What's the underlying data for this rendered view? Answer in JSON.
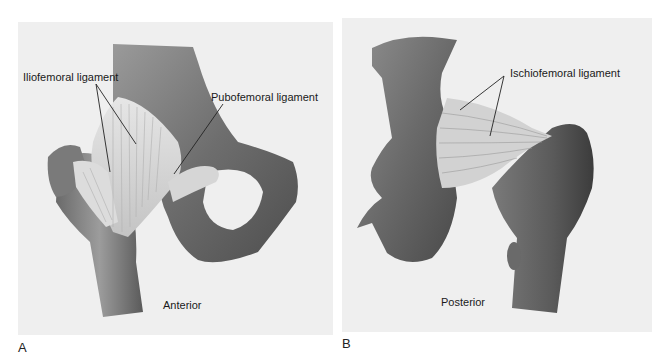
{
  "figure": {
    "panels": [
      {
        "letter": "A",
        "view_label": "Anterior",
        "annotations": [
          {
            "text": "Iliofemoral ligament"
          },
          {
            "text": "Pubofemoral ligament"
          }
        ]
      },
      {
        "letter": "B",
        "view_label": "Posterior",
        "annotations": [
          {
            "text": "Ischiofemoral ligament"
          }
        ]
      }
    ],
    "colors": {
      "background": "#ffffff",
      "panel_fill": "#efefef",
      "bone_dark": "#5a5a5a",
      "bone_mid": "#8a8a8a",
      "ligament": "#d8d8d8",
      "label_text": "#1a1a1a"
    }
  }
}
